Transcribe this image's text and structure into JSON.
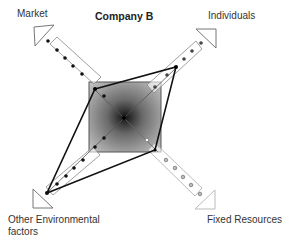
{
  "title": "Company B",
  "axes": [
    {
      "id": "market",
      "label": "Market",
      "direction": "top-left",
      "dot_color": "#111111",
      "dots": 5
    },
    {
      "id": "individuals",
      "label": "Individuals",
      "direction": "top-right",
      "dot_color": "#444444",
      "dots": 5
    },
    {
      "id": "other-environmental-factors",
      "label_line1": "Other Environmental",
      "label_line2": "factors",
      "direction": "bottom-left",
      "dot_color": "#111111",
      "dots": 5
    },
    {
      "id": "fixed-resources",
      "label": "Fixed Resources",
      "direction": "bottom-right",
      "dot_color": "#aaaaaa",
      "dots": 5
    }
  ],
  "profile_polygon": {
    "points": [
      [
        95,
        89
      ],
      [
        176,
        67
      ],
      [
        155,
        150
      ],
      [
        47,
        193
      ]
    ],
    "stroke": "#111111"
  },
  "center_square": {
    "fill_edge": "#9a9a9a",
    "fill_center": "#111111"
  }
}
